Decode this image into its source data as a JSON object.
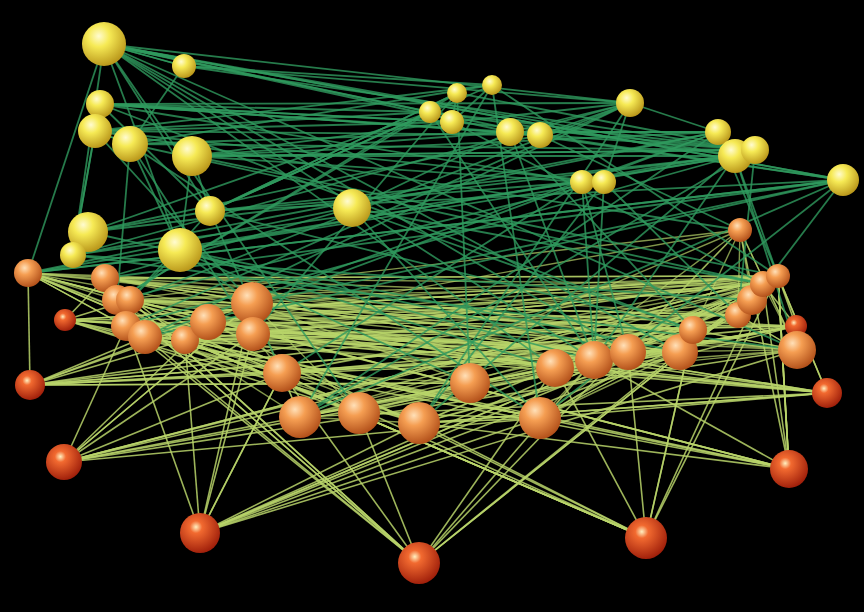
{
  "figure": {
    "title": "",
    "background": "#000000"
  },
  "palette": {
    "top_node": "#f2e64a",
    "mid_node": "#f39a4a",
    "bottom_node": "#e8421c",
    "edge_dark": "#2f9a5e",
    "edge_light": "#b8d46a"
  },
  "nodes": {
    "top": [
      [
        104,
        44,
        22
      ],
      [
        184,
        66,
        12
      ],
      [
        100,
        104,
        14
      ],
      [
        95,
        131,
        17
      ],
      [
        130,
        144,
        18
      ],
      [
        192,
        156,
        20
      ],
      [
        457,
        93,
        10
      ],
      [
        492,
        85,
        10
      ],
      [
        430,
        112,
        11
      ],
      [
        452,
        122,
        12
      ],
      [
        510,
        132,
        14
      ],
      [
        540,
        135,
        13
      ],
      [
        630,
        103,
        14
      ],
      [
        718,
        132,
        13
      ],
      [
        735,
        156,
        17
      ],
      [
        755,
        150,
        14
      ],
      [
        843,
        180,
        16
      ],
      [
        582,
        182,
        12
      ],
      [
        604,
        182,
        12
      ],
      [
        352,
        208,
        19
      ],
      [
        210,
        211,
        15
      ],
      [
        88,
        232,
        20
      ],
      [
        180,
        250,
        22
      ],
      [
        73,
        255,
        13
      ]
    ],
    "middle": [
      [
        28,
        273,
        14
      ],
      [
        105,
        278,
        14
      ],
      [
        117,
        300,
        15
      ],
      [
        130,
        300,
        14
      ],
      [
        126,
        326,
        15
      ],
      [
        145,
        337,
        17
      ],
      [
        185,
        340,
        14
      ],
      [
        208,
        322,
        18
      ],
      [
        252,
        303,
        21
      ],
      [
        253,
        334,
        17
      ],
      [
        282,
        373,
        19
      ],
      [
        300,
        417,
        21
      ],
      [
        359,
        413,
        21
      ],
      [
        419,
        423,
        21
      ],
      [
        470,
        383,
        20
      ],
      [
        540,
        418,
        21
      ],
      [
        555,
        368,
        19
      ],
      [
        594,
        360,
        19
      ],
      [
        628,
        352,
        18
      ],
      [
        680,
        352,
        18
      ],
      [
        693,
        330,
        14
      ],
      [
        738,
        315,
        13
      ],
      [
        752,
        300,
        15
      ],
      [
        763,
        284,
        13
      ],
      [
        778,
        276,
        12
      ],
      [
        797,
        350,
        19
      ],
      [
        740,
        230,
        12
      ]
    ],
    "bottom": [
      [
        30,
        385,
        15
      ],
      [
        65,
        320,
        11
      ],
      [
        64,
        462,
        18
      ],
      [
        827,
        393,
        15
      ],
      [
        796,
        326,
        11
      ],
      [
        200,
        533,
        20
      ],
      [
        419,
        563,
        21
      ],
      [
        646,
        538,
        21
      ],
      [
        789,
        469,
        19
      ]
    ]
  }
}
